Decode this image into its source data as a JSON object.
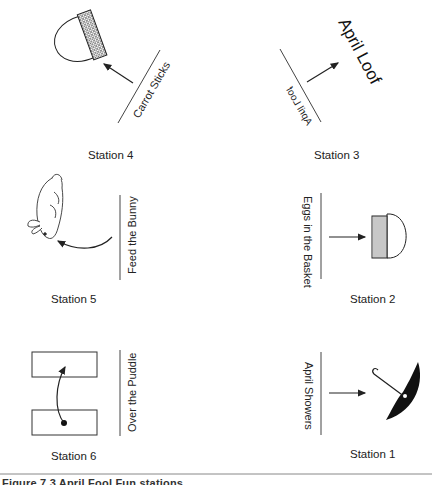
{
  "stations": [
    {
      "id": 1,
      "label": "Station 1",
      "sign": "April Showers",
      "prop": "umbrella"
    },
    {
      "id": 2,
      "label": "Station 2",
      "sign": "Eggs in the Basket",
      "prop": "basket"
    },
    {
      "id": 3,
      "label": "Station 3",
      "sign": "April Loof",
      "prop": "mirrored-text",
      "big_text": "April Loof"
    },
    {
      "id": 4,
      "label": "Station 4",
      "sign": "Carrot Sticks",
      "prop": "basket"
    },
    {
      "id": 5,
      "label": "Station 5",
      "sign": "Feed the Bunny",
      "prop": "bunny"
    },
    {
      "id": 6,
      "label": "Station 6",
      "sign": "Over the Puddle",
      "prop": "two-mats"
    }
  ],
  "caption": "Figure 7.3  April Fool Fun stations",
  "colors": {
    "ink": "#222222",
    "rule": "#888888",
    "background": "#ffffff"
  }
}
